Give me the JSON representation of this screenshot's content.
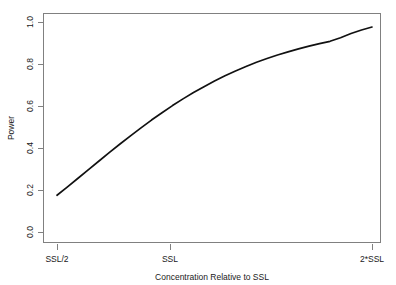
{
  "chart_data": {
    "type": "line",
    "title": "",
    "subtitle": "",
    "xlabel": "Concentration Relative to SSL",
    "ylabel": "Power",
    "grid": false,
    "legend": false,
    "legend_position": "none",
    "xlim": [
      0.5,
      2.0
    ],
    "ylim": [
      0.0,
      1.0
    ],
    "x_tick_positions": [
      0.5,
      1.0,
      2.0
    ],
    "x_tick_labels": [
      "SSL/2",
      "SSL",
      "2*SSL"
    ],
    "y_tick_positions": [
      0.0,
      0.2,
      0.4,
      0.6,
      0.8,
      1.0
    ],
    "y_tick_labels": [
      "0.0",
      "0.2",
      "0.4",
      "0.6",
      "0.8",
      "1.0"
    ],
    "series": [
      {
        "name": "Power",
        "color": "#111111",
        "x": [
          0.5,
          0.55,
          0.6,
          0.65,
          0.7,
          0.75,
          0.8,
          0.85,
          0.9,
          0.95,
          1.0,
          1.05,
          1.1,
          1.15,
          1.2,
          1.25,
          1.3,
          1.35,
          1.4,
          1.45,
          1.5,
          1.55,
          1.6,
          1.65,
          1.7,
          1.75,
          1.8,
          1.85,
          1.9,
          1.95,
          2.0
        ],
        "y": [
          0.175,
          0.215,
          0.256,
          0.297,
          0.338,
          0.379,
          0.419,
          0.458,
          0.496,
          0.533,
          0.568,
          0.602,
          0.634,
          0.664,
          0.692,
          0.719,
          0.744,
          0.767,
          0.788,
          0.808,
          0.826,
          0.843,
          0.858,
          0.872,
          0.885,
          0.897,
          0.908,
          0.925,
          0.945,
          0.962,
          0.976
        ]
      }
    ],
    "annotations": []
  },
  "figure": {
    "background_color": "#ffffff",
    "frame_color": "#808080",
    "text_color": "#1a1a1a"
  }
}
